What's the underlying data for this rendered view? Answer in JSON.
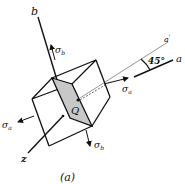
{
  "figure": {
    "caption": "(a)",
    "axes": {
      "b": "b",
      "a": "a",
      "a_prime": "a'",
      "z": "z"
    },
    "point_label": "Q",
    "angle_label": "45°",
    "stresses": {
      "sigma_a_right": "σa",
      "sigma_a_left": "σa",
      "sigma_b_top": "σb",
      "sigma_b_bottom": "σb"
    },
    "colors": {
      "line": "#111111",
      "shaded_plane": "#c8c8c8",
      "axis_gray": "#888888"
    }
  }
}
